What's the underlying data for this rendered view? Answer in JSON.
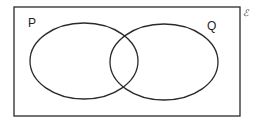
{
  "diagram": {
    "type": "venn",
    "universal_set_label": "ℰ",
    "sets": [
      {
        "label": "P",
        "cx": 84,
        "cy": 61,
        "rx": 54,
        "ry": 38
      },
      {
        "label": "Q",
        "cx": 164,
        "cy": 62,
        "rx": 54,
        "ry": 38
      }
    ],
    "universe_rect": {
      "x": 14,
      "y": 7,
      "width": 226,
      "height": 109
    },
    "stroke_color": "#2a2a2a",
    "background": "#ffffff"
  }
}
